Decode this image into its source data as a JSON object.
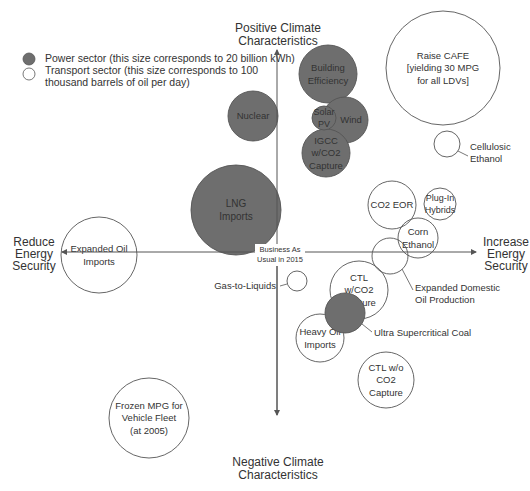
{
  "legend": {
    "items": [
      {
        "label": "Power sector (this size corresponds to 20 billion kWh)",
        "fill": "#6e6e6e"
      },
      {
        "label_lines": [
          "Transport sector (this size corresponds to 100",
          " thousand barrels of oil per day)"
        ],
        "fill": "#ffffff"
      }
    ]
  },
  "axes": {
    "top": [
      "Positive Climate",
      "Characteristics"
    ],
    "bottom": [
      "Negative Climate",
      "Characteristics"
    ],
    "left": [
      "Reduce",
      "Energy",
      "Security"
    ],
    "right": [
      "Increase",
      "Energy",
      "Security"
    ],
    "origin": [
      "Business As",
      "Usual in 2015"
    ]
  },
  "colors": {
    "power": "#6e6e6e",
    "transport": "#ffffff",
    "stroke": "#555555",
    "axis": "#555555",
    "text": "#333333"
  },
  "bubbles": [
    {
      "id": "raise-cafe",
      "sector": "transport",
      "lines": [
        "Raise CAFE",
        "[yielding 30 MPG",
        "for all LDVs]"
      ]
    },
    {
      "id": "cellulosic-ethanol",
      "sector": "transport",
      "lines": [],
      "callout": [
        "Cellulosic",
        "Ethanol"
      ]
    },
    {
      "id": "building-efficiency",
      "sector": "power",
      "lines": [
        "Building",
        "Efficiency"
      ]
    },
    {
      "id": "wind",
      "sector": "power",
      "lines": [
        "Wind"
      ]
    },
    {
      "id": "solar-pv",
      "sector": "power",
      "lines": [
        "Solar",
        "PV"
      ]
    },
    {
      "id": "igcc",
      "sector": "power",
      "lines": [
        "IGCC",
        "w/CO2",
        "Capture"
      ]
    },
    {
      "id": "nuclear",
      "sector": "power",
      "lines": [
        "Nuclear"
      ]
    },
    {
      "id": "lng-imports",
      "sector": "power",
      "lines": [
        "LNG",
        "Imports"
      ]
    },
    {
      "id": "co2-eor",
      "sector": "transport",
      "lines": [
        "CO2 EOR"
      ]
    },
    {
      "id": "plug-in-hybrids",
      "sector": "transport",
      "lines": [
        "Plug-In",
        "Hybrids"
      ]
    },
    {
      "id": "corn-ethanol",
      "sector": "transport",
      "lines": [
        "Corn",
        "Ethanol"
      ]
    },
    {
      "id": "expanded-domestic-oil",
      "sector": "transport",
      "lines": [],
      "callout": [
        "Expanded Domestic",
        "Oil Production"
      ]
    },
    {
      "id": "ctl-with-co2",
      "sector": "transport",
      "lines": [
        "CTL",
        "w/CO2",
        "Capture"
      ]
    },
    {
      "id": "heavy-oil-imports",
      "sector": "transport",
      "lines": [
        "Heavy Oil",
        "Imports"
      ]
    },
    {
      "id": "ultra-supercritical-coal",
      "sector": "power",
      "lines": [],
      "callout": [
        "Ultra Supercritical Coal"
      ]
    },
    {
      "id": "ctl-without-co2",
      "sector": "transport",
      "lines": [
        "CTL w/o",
        "CO2",
        "Capture"
      ]
    },
    {
      "id": "gas-to-liquids",
      "sector": "transport",
      "lines": [],
      "callout": [
        "Gas-to-Liquids"
      ]
    },
    {
      "id": "expanded-oil-imports",
      "sector": "transport",
      "lines": [
        "Expanded Oil",
        "Imports"
      ]
    },
    {
      "id": "frozen-mpg",
      "sector": "transport",
      "lines": [
        "Frozen MPG for",
        "Vehicle Fleet",
        "(at 2005)"
      ]
    }
  ]
}
